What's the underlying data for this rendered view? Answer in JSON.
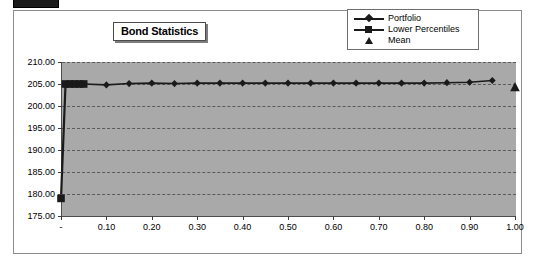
{
  "window": {
    "top_chrome_label": ""
  },
  "chart": {
    "title": "Bond Statistics",
    "legend": [
      {
        "label": "Portfolio",
        "marker": "diamond-marker",
        "has_line": true,
        "color": "#1a1a1a"
      },
      {
        "label": "Lower Percentiles",
        "marker": "square-marker",
        "has_line": true,
        "color": "#1a1a1a"
      },
      {
        "label": "Mean",
        "marker": "triangle-marker",
        "has_line": false,
        "color": "#1a1a1a"
      }
    ],
    "plot_background": "#a9a9a9",
    "axis_color": "#4d4d4d",
    "gridline_color": "#5a5a5a"
  },
  "chart_data": {
    "type": "line",
    "title": "Bond Statistics",
    "xlabel": "",
    "ylabel": "",
    "xlim": [
      0.0,
      1.0
    ],
    "ylim": [
      175.0,
      210.0
    ],
    "grid": true,
    "legend_position": "top-right",
    "x_tick_labels": [
      "-",
      "0.10",
      "0.20",
      "0.30",
      "0.40",
      "0.50",
      "0.60",
      "0.70",
      "0.80",
      "0.90",
      "1.00"
    ],
    "x_ticks": [
      0.0,
      0.1,
      0.2,
      0.3,
      0.4,
      0.5,
      0.6,
      0.7,
      0.8,
      0.9,
      1.0
    ],
    "y_tick_labels": [
      "175.00",
      "180.00",
      "185.00",
      "190.00",
      "195.00",
      "200.00",
      "205.00",
      "210.00"
    ],
    "y_ticks": [
      175.0,
      180.0,
      185.0,
      190.0,
      195.0,
      200.0,
      205.0,
      210.0
    ],
    "series": [
      {
        "name": "Portfolio",
        "marker": "diamond",
        "x": [
          0.05,
          0.1,
          0.15,
          0.2,
          0.25,
          0.3,
          0.35,
          0.4,
          0.45,
          0.5,
          0.55,
          0.6,
          0.65,
          0.7,
          0.75,
          0.8,
          0.85,
          0.9,
          0.95
        ],
        "values": [
          205.0,
          204.8,
          205.1,
          205.2,
          205.1,
          205.2,
          205.2,
          205.2,
          205.2,
          205.2,
          205.2,
          205.2,
          205.2,
          205.2,
          205.2,
          205.2,
          205.3,
          205.4,
          205.8
        ]
      },
      {
        "name": "Lower Percentiles",
        "marker": "square",
        "x": [
          0.0,
          0.01,
          0.02,
          0.03,
          0.04,
          0.05
        ],
        "values": [
          179.0,
          205.0,
          205.0,
          205.0,
          205.0,
          205.0
        ]
      },
      {
        "name": "Mean",
        "marker": "triangle",
        "x": [
          1.0
        ],
        "values": [
          204.3
        ]
      }
    ]
  }
}
